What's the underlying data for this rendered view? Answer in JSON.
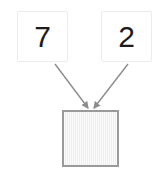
{
  "canvas": {
    "width": 168,
    "height": 180,
    "background_color": "#ffffff"
  },
  "diagram": {
    "type": "arithmetic-operands-to-result",
    "operands": [
      {
        "name": "left-operand",
        "value": "7",
        "text_color": "#1c1c1c",
        "box_fill": "#ffffff",
        "box_border": "#ececec"
      },
      {
        "name": "right-operand",
        "value": "2",
        "text_color": "#1c1c1c",
        "box_fill": "#ffffff",
        "box_border": "#ececec"
      }
    ],
    "result": {
      "name": "result-slot",
      "value": "",
      "state": "empty",
      "box_fill": "#f1f1f1",
      "box_border": "#9a9a9a"
    },
    "arrows": {
      "count": 2,
      "color": "#8c8c8c",
      "style": "solid-line-with-filled-head",
      "direction": "operands-to-result"
    }
  }
}
